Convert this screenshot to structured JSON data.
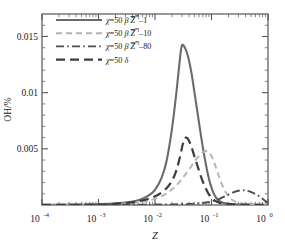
{
  "chart_data": {
    "type": "line",
    "title": "",
    "xlabel": "Z",
    "ylabel": "OH/%",
    "xscale": "log",
    "yscale": "linear",
    "xlim": [
      0.0001,
      1
    ],
    "ylim": [
      0,
      0.017
    ],
    "grid": false,
    "legend_position": "top-left",
    "xtick_labels": [
      "10-4",
      "10-3",
      "10-2",
      "10-1",
      "10-0"
    ],
    "xtick_bases": [
      "10",
      "10",
      "10",
      "10",
      "10"
    ],
    "xtick_exponents": [
      "-4",
      "-3",
      "-2",
      "-1",
      "0"
    ],
    "xtick_values": [
      0.0001,
      0.001,
      0.01,
      0.1,
      1
    ],
    "ytick_labels": [
      "0.005",
      "0.01",
      "0.015"
    ],
    "ytick_values": [
      0.005,
      0.01,
      0.015
    ],
    "series": [
      {
        "name": "chi=50 beta Z\"2-1",
        "label_chi": "χ",
        "label_eq": "=50",
        "label_beta": "β",
        "label_zvar": "Z",
        "label_sup": "″²",
        "label_suffix": "–1",
        "style": "solid",
        "color": "#6b6b6b",
        "width": 2.1,
        "peak_x": 0.03,
        "peak_y": 0.0142,
        "x": [
          0.0001,
          0.0003,
          0.0006,
          0.001,
          0.0018,
          0.003,
          0.0045,
          0.006,
          0.008,
          0.01,
          0.013,
          0.016,
          0.02,
          0.024,
          0.028,
          0.03,
          0.033,
          0.038,
          0.044,
          0.05,
          0.057,
          0.065,
          0.075,
          0.085,
          0.095,
          0.11,
          0.13,
          0.16,
          0.2,
          0.3,
          0.5,
          1.0
        ],
        "y": [
          2e-05,
          3e-05,
          5e-05,
          8e-05,
          0.00013,
          0.00022,
          0.00035,
          0.00055,
          0.0009,
          0.00135,
          0.0024,
          0.0039,
          0.0068,
          0.0101,
          0.0133,
          0.0142,
          0.0141,
          0.0133,
          0.0118,
          0.01,
          0.0081,
          0.0062,
          0.0043,
          0.0029,
          0.0019,
          0.001,
          0.00045,
          0.0002,
          0.0001,
          5e-05,
          3e-05,
          2e-05
        ]
      },
      {
        "name": "chi=50 beta Z\"2-10",
        "label_chi": "χ",
        "label_eq": "=50",
        "label_beta": "β",
        "label_zvar": "Z",
        "label_sup": "″²",
        "label_suffix": "–10",
        "style": "dashed",
        "color": "#b3b3b3",
        "width": 1.9,
        "peak_x": 0.08,
        "peak_y": 0.0048,
        "x": [
          0.0001,
          0.0005,
          0.001,
          0.002,
          0.004,
          0.007,
          0.01,
          0.015,
          0.02,
          0.026,
          0.033,
          0.042,
          0.052,
          0.062,
          0.072,
          0.08,
          0.09,
          0.1,
          0.115,
          0.13,
          0.15,
          0.18,
          0.22,
          0.28,
          0.35,
          0.45,
          0.6,
          0.8,
          1.0
        ],
        "y": [
          1e-05,
          2e-05,
          4e-05,
          8e-05,
          0.00018,
          0.00035,
          0.00055,
          0.00095,
          0.0014,
          0.00195,
          0.0026,
          0.0033,
          0.004,
          0.00445,
          0.00473,
          0.0048,
          0.0047,
          0.00435,
          0.0036,
          0.0028,
          0.00195,
          0.0011,
          0.00055,
          0.00025,
          0.00014,
          8e-05,
          5e-05,
          3e-05,
          2e-05
        ]
      },
      {
        "name": "chi=50 beta Z\"2-80",
        "label_chi": "χ",
        "label_eq": "=50",
        "label_beta": "β",
        "label_zvar": "Z",
        "label_sup": "″²",
        "label_suffix": "–80",
        "style": "dashdot",
        "color": "#4d4d4d",
        "width": 1.9,
        "peak_x": 0.35,
        "peak_y": 0.0013,
        "x": [
          0.0001,
          0.001,
          0.005,
          0.01,
          0.02,
          0.04,
          0.06,
          0.08,
          0.1,
          0.13,
          0.16,
          0.2,
          0.25,
          0.3,
          0.35,
          0.4,
          0.45,
          0.52,
          0.6,
          0.7,
          0.8,
          0.9,
          1.0
        ],
        "y": [
          1e-05,
          2e-05,
          3e-05,
          4e-05,
          6e-05,
          0.0001,
          0.00015,
          0.00022,
          0.00032,
          0.0005,
          0.0007,
          0.00093,
          0.00115,
          0.00127,
          0.00131,
          0.00129,
          0.00123,
          0.00112,
          0.00098,
          0.00078,
          0.00056,
          0.00035,
          0.00018
        ]
      },
      {
        "name": "chi=50 delta",
        "label_chi": "χ",
        "label_eq": "=50",
        "label_beta": "",
        "label_zvar": "",
        "label_sup": "",
        "label_suffix": "δ",
        "style": "longdash",
        "color": "#3d3d3d",
        "width": 2.2,
        "peak_x": 0.03,
        "peak_y": 0.006,
        "x": [
          0.0001,
          0.0005,
          0.001,
          0.002,
          0.004,
          0.006,
          0.009,
          0.012,
          0.016,
          0.02,
          0.024,
          0.028,
          0.031,
          0.034,
          0.038,
          0.044,
          0.05,
          0.058,
          0.067,
          0.078,
          0.09,
          0.105,
          0.125,
          0.15,
          0.2,
          0.3,
          0.5,
          1.0
        ],
        "y": [
          1e-05,
          2e-05,
          4e-05,
          0.0001,
          0.00024,
          0.0004,
          0.00068,
          0.00098,
          0.0015,
          0.00215,
          0.0031,
          0.0044,
          0.0054,
          0.00595,
          0.0059,
          0.0052,
          0.0043,
          0.0033,
          0.00235,
          0.00155,
          0.00095,
          0.00055,
          0.00028,
          0.00014,
          7e-05,
          4e-05,
          2e-05,
          1e-05
        ]
      }
    ]
  },
  "axes": {
    "x_label": "Z",
    "y_label": "OH/%"
  }
}
